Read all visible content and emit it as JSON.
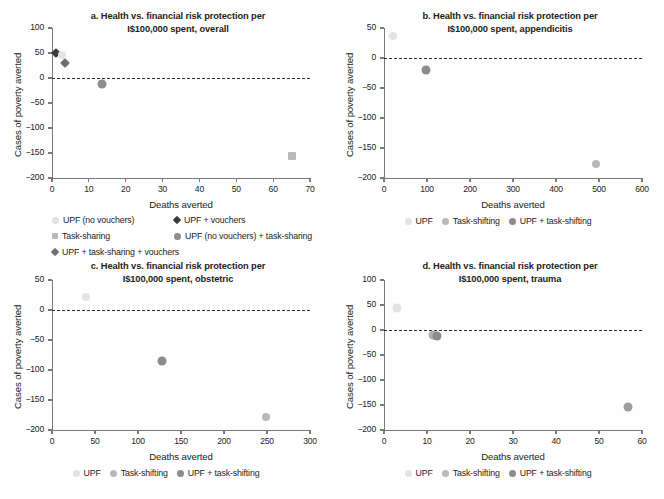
{
  "figure": {
    "background": "#fefefe",
    "axis_color": "#7a7a7a",
    "text_color": "#231f20"
  },
  "colors": {
    "upf_no_vouchers": "#e3e3e1",
    "upf_vouchers": "#3b3b3b",
    "task_sharing": "#b9b9b9",
    "upf_task_sharing": "#8c8c8c",
    "upf_task_sharing_vouchers": "#6e6e6e",
    "upf_light": "#e3e3e1",
    "task_shifting": "#b9b9b9",
    "upf_task_shifting": "#8c8c8c"
  },
  "legend_main": {
    "items": [
      {
        "label": "UPF (no vouchers)",
        "marker": "circle",
        "color": "#e3e3e1",
        "size": 7
      },
      {
        "label": "UPF + vouchers",
        "marker": "diamond",
        "color": "#3b3b3b",
        "size": 6
      },
      {
        "label": "Task-sharing",
        "marker": "square",
        "color": "#b9b9b9",
        "size": 6
      },
      {
        "label": "UPF (no vouchers) + task-sharing",
        "marker": "circle",
        "color": "#8c8c8c",
        "size": 7
      },
      {
        "label": "UPF + task-sharing + vouchers",
        "marker": "diamond",
        "color": "#6e6e6e",
        "size": 6
      }
    ]
  },
  "legend_sub": {
    "items": [
      {
        "label": "UPF",
        "marker": "circle",
        "color": "#e3e3e1",
        "size": 7
      },
      {
        "label": "Task-shifting",
        "marker": "circle",
        "color": "#b9b9b9",
        "size": 7
      },
      {
        "label": "UPF + task-shifting",
        "marker": "circle",
        "color": "#8c8c8c",
        "size": 7
      }
    ]
  },
  "chart_data": [
    {
      "id": "a",
      "type": "scatter",
      "title": "a. Health vs. financial risk protection per I$100,000 spent, overall",
      "title_line1": "a. Health vs. financial risk protection per",
      "title_line2": "I$100,000 spent, overall",
      "xlabel": "Deaths averted",
      "ylabel": "Cases of poverty averted",
      "xlim": [
        0,
        70
      ],
      "ylim": [
        -200,
        100
      ],
      "xticks": [
        0,
        10,
        20,
        30,
        40,
        50,
        60,
        70
      ],
      "yticks": [
        100,
        50,
        0,
        -50,
        -100,
        -150,
        -200
      ],
      "grid": false,
      "zero_reference_line": 0,
      "legend_position": "below-figure",
      "points": [
        {
          "series": "UPF + vouchers",
          "x": 1.2,
          "y": 51,
          "marker": "diamond",
          "color": "#3b3b3b",
          "size": 7
        },
        {
          "series": "UPF (no vouchers)",
          "x": 2.6,
          "y": 46,
          "marker": "circle",
          "color": "#e3e3e1",
          "size": 8
        },
        {
          "series": "UPF + task-sharing + vouchers",
          "x": 3.6,
          "y": 30,
          "marker": "diamond",
          "color": "#6e6e6e",
          "size": 7
        },
        {
          "series": "UPF (no vouchers) + task-sharing",
          "x": 13.6,
          "y": -11,
          "marker": "circle",
          "color": "#8c8c8c",
          "size": 9
        },
        {
          "series": "Task-sharing",
          "x": 65,
          "y": -155,
          "marker": "square",
          "color": "#b9b9b9",
          "size": 8
        }
      ]
    },
    {
      "id": "b",
      "type": "scatter",
      "title": "b. Health vs. financial risk protection per I$100,000 spent, appendicitis",
      "title_line1": "b. Health vs. financial risk protection per",
      "title_line2": "I$100,000 spent, appendicitis",
      "xlabel": "Deaths averted",
      "ylabel": "Cases of poverty averted",
      "xlim": [
        0,
        600
      ],
      "ylim": [
        -200,
        50
      ],
      "xticks": [
        0,
        100,
        200,
        300,
        400,
        500,
        600
      ],
      "yticks": [
        50,
        0,
        -50,
        -100,
        -150,
        -200
      ],
      "grid": false,
      "zero_reference_line": 0,
      "legend_position": "below-panel",
      "points": [
        {
          "series": "UPF",
          "x": 22,
          "y": 37,
          "marker": "circle",
          "color": "#e3e3e1",
          "size": 8
        },
        {
          "series": "UPF + task-shifting",
          "x": 97,
          "y": -20,
          "marker": "circle",
          "color": "#8c8c8c",
          "size": 9
        },
        {
          "series": "Task-shifting",
          "x": 493,
          "y": -177,
          "marker": "circle",
          "color": "#b9b9b9",
          "size": 8
        }
      ]
    },
    {
      "id": "c",
      "type": "scatter",
      "title": "c. Health vs. financial risk protection per I$100,000 spent, obstetric",
      "title_line1": "c. Health vs. financial risk protection per",
      "title_line2": "I$100,000 spent, obstetric",
      "xlabel": "Deaths averted",
      "ylabel": "Cases of poverty averted",
      "xlim": [
        0,
        300
      ],
      "ylim": [
        -200,
        50
      ],
      "xticks": [
        0,
        50,
        100,
        150,
        200,
        250,
        300
      ],
      "yticks": [
        50,
        0,
        -50,
        -100,
        -150,
        -200
      ],
      "grid": false,
      "zero_reference_line": 0,
      "legend_position": "below-panel",
      "points": [
        {
          "series": "UPF",
          "x": 40,
          "y": 21,
          "marker": "circle",
          "color": "#e3e3e1",
          "size": 8
        },
        {
          "series": "UPF + task-shifting",
          "x": 128,
          "y": -85,
          "marker": "circle",
          "color": "#8c8c8c",
          "size": 9
        },
        {
          "series": "Task-shifting",
          "x": 249,
          "y": -179,
          "marker": "circle",
          "color": "#b9b9b9",
          "size": 8
        }
      ]
    },
    {
      "id": "d",
      "type": "scatter",
      "title": "d. Health vs. financial risk protection per I$100,000 spent, trauma",
      "title_line1": "d. Health vs. financial risk protection per",
      "title_line2": "I$100,000 spent, trauma",
      "xlabel": "Deaths averted",
      "ylabel": "Cases of poverty averted",
      "xlim": [
        0,
        60
      ],
      "ylim": [
        -200,
        100
      ],
      "xticks": [
        0,
        10,
        20,
        30,
        40,
        50,
        60
      ],
      "yticks": [
        100,
        50,
        0,
        -50,
        -100,
        -150,
        -200
      ],
      "grid": false,
      "zero_reference_line": 0,
      "legend_position": "below-panel",
      "points": [
        {
          "series": "UPF",
          "x": 3,
          "y": 44,
          "marker": "circle",
          "color": "#e3e3e1",
          "size": 9
        },
        {
          "series": "UPF + task-shifting",
          "x": 11.3,
          "y": -9,
          "marker": "circle",
          "color": "#b0b0b0",
          "size": 9
        },
        {
          "series": "UPF + task-shifting",
          "x": 12.4,
          "y": -12,
          "marker": "circle",
          "color": "#8c8c8c",
          "size": 9
        },
        {
          "series": "Task-shifting",
          "x": 56.8,
          "y": -154,
          "marker": "circle",
          "color": "#9e9e9e",
          "size": 9
        }
      ]
    }
  ]
}
